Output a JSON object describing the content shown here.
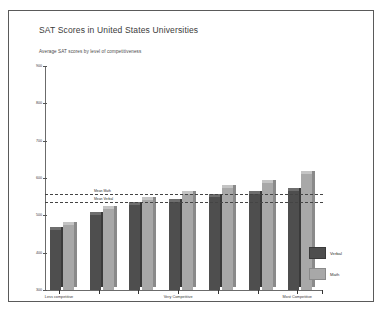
{
  "chart_data": {
    "type": "bar",
    "title": "SAT Scores in United States Universities",
    "subtitle": "Average SAT scores by level of competitiveness",
    "xlabel": "",
    "ylabel": "",
    "ylim": [
      300,
      900
    ],
    "yticks": [
      300,
      400,
      500,
      600,
      700,
      800,
      900
    ],
    "ytick_labels": [
      "300",
      "400",
      "500",
      "600",
      "700",
      "800",
      "900"
    ],
    "grid": false,
    "legend_position": "right",
    "categories": [
      "Less competitive",
      "Competitive",
      "Competitive+",
      "Very Competitive",
      "Very Competitive+",
      "Highly Competitive",
      "Most Competitive"
    ],
    "x_axis_visible_labels": [
      {
        "label": "Less competitive",
        "index": 0
      },
      {
        "label": "Very Competitive",
        "index": 3
      },
      {
        "label": "Most Competitive",
        "index": 6
      }
    ],
    "series": [
      {
        "name": "Verbal",
        "color": "#4e4e4e",
        "values": [
          462,
          502,
          528,
          536,
          548,
          556,
          566
        ]
      },
      {
        "name": "Math",
        "color": "#a8a8a8",
        "values": [
          474,
          516,
          540,
          556,
          572,
          586,
          610
        ]
      }
    ],
    "reference_lines": [
      {
        "label": "Mean Math",
        "value": 556,
        "style": "dashed"
      },
      {
        "label": "Mean Verbal",
        "value": 536,
        "style": "dashed"
      }
    ]
  },
  "legend": {
    "entries": [
      {
        "label": "Verbal",
        "swatch": "verbal"
      },
      {
        "label": "Math",
        "swatch": "math"
      }
    ]
  }
}
